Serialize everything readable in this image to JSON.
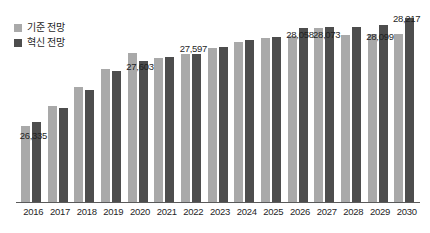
{
  "chart_data": {
    "type": "bar",
    "title": "",
    "subtitle": "",
    "xlabel": "",
    "ylabel": "",
    "grid": false,
    "legend_position": "top-left",
    "ylim": [
      25000,
      28400
    ],
    "categories": [
      "2016",
      "2017",
      "2018",
      "2019",
      "2020",
      "2021",
      "2022",
      "2023",
      "2024",
      "2025",
      "2026",
      "2027",
      "2028",
      "2029",
      "2030"
    ],
    "series": [
      {
        "name": "기준 전망",
        "color": "#a9a9a9",
        "values": [
          26335,
          26680,
          27010,
          27330,
          27603,
          27520,
          27597,
          27700,
          27800,
          27880,
          27910,
          28058,
          27930,
          27940,
          27950
        ]
      },
      {
        "name": "혁신 전망",
        "color": "#4d4d4d",
        "values": [
          26400,
          26640,
          26960,
          27300,
          27480,
          27540,
          27600,
          27720,
          27840,
          27890,
          28058,
          28073,
          28070,
          28099,
          28217
        ]
      }
    ],
    "point_labels": [
      {
        "category": "2016",
        "text": "26,335",
        "value": 26335,
        "x_pct": 3.8,
        "y_px": 131
      },
      {
        "category": "2020",
        "text": "27,603",
        "value": 27603,
        "x_pct": 30.5,
        "y_px": 62
      },
      {
        "category": "2022",
        "text": "27,597",
        "value": 27597,
        "x_pct": 44.0,
        "y_px": 44
      },
      {
        "category": "2026",
        "text": "28,058",
        "value": 28058,
        "x_pct": 70.5,
        "y_px": 30
      },
      {
        "category": "2027",
        "text": "28,073",
        "value": 28073,
        "x_pct": 83.5,
        "y_px": 30
      },
      {
        "category": "2029",
        "text": "28,099",
        "value": 28099,
        "x_pct": 96.5,
        "y_px": 32
      },
      {
        "category": "2030",
        "text": "28,217",
        "value": 28217,
        "x_pct": 108.0,
        "y_px": 14
      }
    ]
  },
  "legend": {
    "items": [
      {
        "label": "기준 전망",
        "color": "#a9a9a9",
        "swatch": "legend-swatch-base"
      },
      {
        "label": "혁신 전망",
        "color": "#4d4d4d",
        "swatch": "legend-swatch-innovation"
      }
    ]
  },
  "axis": {
    "baseline_color": "#5a5a5a"
  }
}
